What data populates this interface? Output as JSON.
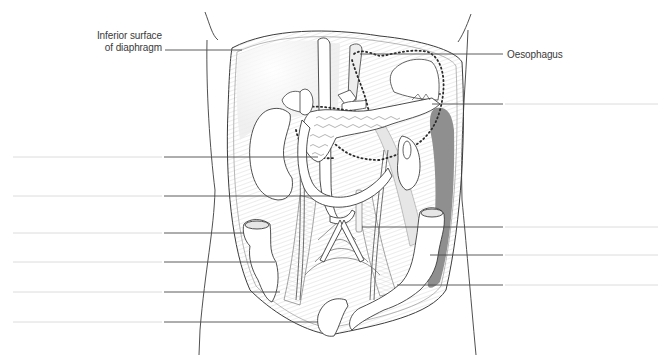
{
  "diagram": {
    "colors": {
      "outline": "#3c3c3c",
      "leader": "#4a4a4a",
      "blank_line": "#dcdcdc",
      "hatch": "#c8c8c8",
      "shade_dark": "#8e8e8e",
      "shade_light": "#e4e4e4",
      "organ_fill": "#ffffff",
      "text": "#3a3a3a"
    },
    "labels": [
      {
        "id": "diaphragm",
        "line1": "Inferior surface",
        "line2": "of diaphragm",
        "side": "left"
      },
      {
        "id": "oesophagus",
        "line1": "Oesophagus",
        "side": "right"
      }
    ],
    "blank_label_slots": {
      "left": [
        {
          "y": 157,
          "target_x": 318
        },
        {
          "y": 196,
          "target_x": 330
        },
        {
          "y": 233,
          "target_x": 244
        },
        {
          "y": 262,
          "target_x": 275
        },
        {
          "y": 292,
          "target_x": 280
        },
        {
          "y": 322,
          "target_x": 318
        }
      ],
      "right": [
        {
          "y": 104,
          "target_x": 432
        },
        {
          "y": 227,
          "target_x": 362
        },
        {
          "y": 255,
          "target_x": 430
        },
        {
          "y": 285,
          "target_x": 397
        }
      ]
    }
  }
}
